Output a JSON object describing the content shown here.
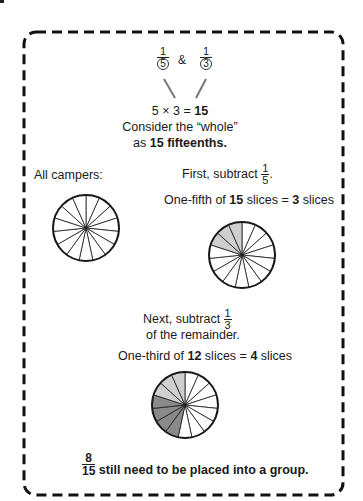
{
  "top": {
    "fraction_a": {
      "numerator": "1",
      "denominator": "5"
    },
    "ampersand": "&",
    "fraction_b": {
      "numerator": "1",
      "denominator": "3"
    },
    "equation_prefix": "5 × 3 = ",
    "equation_result": "15",
    "consider_line": "Consider the “whole”",
    "as_prefix": "as ",
    "as_bold": "15 fifteenths."
  },
  "left": {
    "label": "All campers:"
  },
  "step1": {
    "prefix": "First, subtract",
    "fraction": {
      "numerator": "1",
      "denominator": "5"
    },
    "suffix": ".",
    "calc_a": "One-fifth of ",
    "calc_b": "15",
    "calc_c": " slices = ",
    "calc_d": "3",
    "calc_e": " slices"
  },
  "step2": {
    "prefix": "Next, subtract",
    "fraction": {
      "numerator": "1",
      "denominator": "3"
    },
    "line2": "of the remainder.",
    "calc_a": "One-third of ",
    "calc_b": "12",
    "calc_c": " slices = ",
    "calc_d": "4",
    "calc_e": " slices"
  },
  "conclusion": {
    "fraction": {
      "numerator": "8",
      "denominator": "15"
    },
    "text": "still need to be placed into a group."
  },
  "pies": [
    {
      "name": "all-campers",
      "slices": 15,
      "light": [],
      "dark": []
    },
    {
      "name": "after-one-fifth",
      "slices": 15,
      "light": [
        12,
        13,
        14
      ],
      "dark": []
    },
    {
      "name": "after-one-third",
      "slices": 15,
      "light": [
        12,
        13,
        14
      ],
      "dark": [
        8,
        9,
        10,
        11
      ]
    }
  ],
  "colors": {
    "light_fill": "#cfcfcf",
    "dark_fill": "#8a8a8a",
    "stroke": "#1a1a1a"
  }
}
